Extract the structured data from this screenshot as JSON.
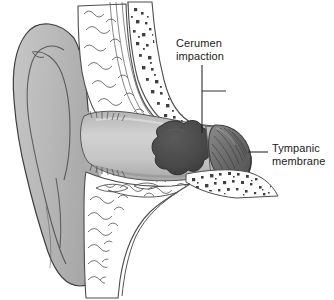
{
  "figure": {
    "name": "ear-cross-section-cerumen-impaction",
    "background_color": "#ffffff"
  },
  "labels": {
    "cerumen": {
      "line1": "Cerumen",
      "line2": "impaction",
      "leader": "vertical-line"
    },
    "tympanic": {
      "line1": "Tympanic",
      "line2": "membrane",
      "leader": "horizontal-line"
    }
  },
  "colors": {
    "outline": "#3a3a3a",
    "pinna_fill": "#b9b9b9",
    "pinna_shadow": "#a3a3a3",
    "canal_fill": "#c9c9c9",
    "canal_light": "#dcdcdc",
    "cerumen_fill": "#4c4c4c",
    "cerumen_shadow": "#3d3d3d",
    "tympanic_fill": "#6d6d6d",
    "tympanic_shadow": "#565656",
    "bone_stipple": "#444444",
    "cartilage_stroke": "#555555",
    "text": "#1a1a1a"
  },
  "anatomy": {
    "parts": [
      "pinna",
      "external-auditory-canal",
      "cerumen-impaction-mass",
      "tympanic-membrane",
      "temporal-bone-stippled",
      "cartilage-tissue",
      "muscle-fibers",
      "canal-hairs"
    ]
  }
}
